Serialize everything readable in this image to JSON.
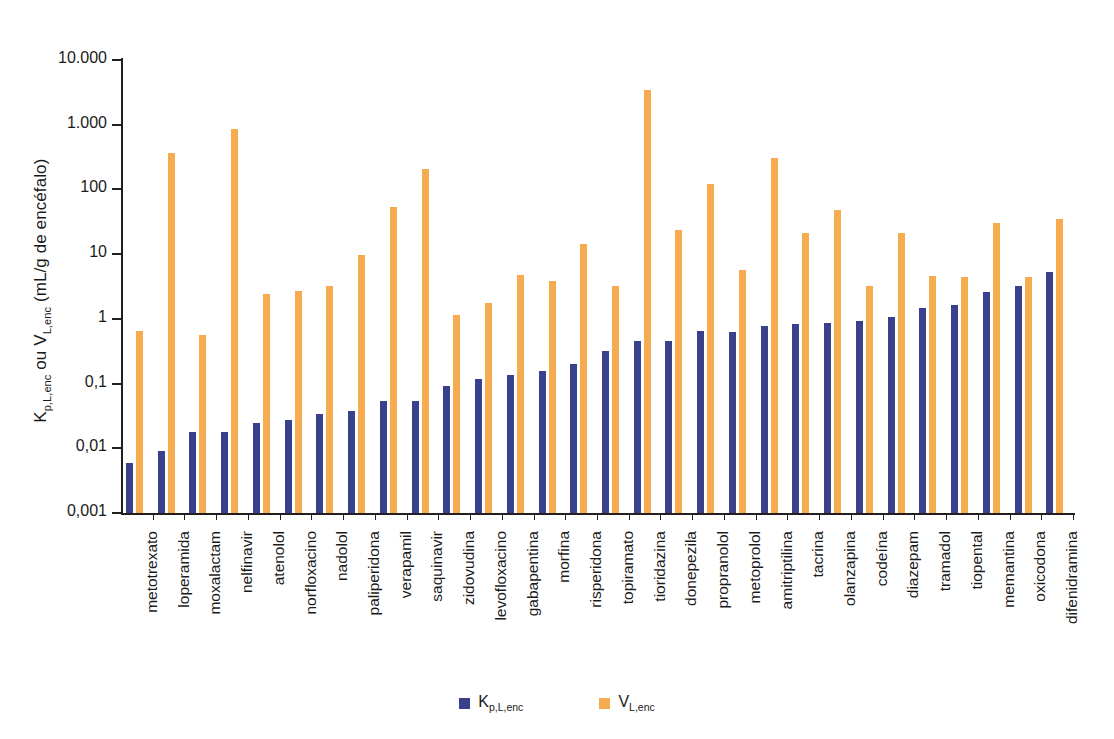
{
  "chart_data": {
    "type": "bar",
    "title": "",
    "xlabel": "",
    "ylabel_html": "K<sub>p,L,enc</sub> ou V<sub>L,enc</sub> (mL/g de encéfalo)",
    "ylabel_text": "Kp,L,enc ou VL,enc (mL/g de encéfalo)",
    "yscale": "log",
    "ylim": [
      0.001,
      10000
    ],
    "ytick_labels": [
      "10.000",
      "1.000",
      "100",
      "10",
      "1",
      "0,1",
      "0,01",
      "0,001"
    ],
    "ytick_values": [
      10000,
      1000,
      100,
      10,
      1,
      0.1,
      0.01,
      0.001
    ],
    "grid": false,
    "legend_position": "bottom-center",
    "categories": [
      "metotrexato",
      "loperamida",
      "moxalactam",
      "nelfinavir",
      "atenolol",
      "norfloxacino",
      "nadolol",
      "paliperidona",
      "verapamil",
      "saquinavir",
      "zidovudina",
      "levofloxacino",
      "gabapentina",
      "morfina",
      "risperidona",
      "topiramato",
      "tioridazina",
      "donepezila",
      "propranolol",
      "metoprolol",
      "amitriptilina",
      "tacrina",
      "olanzapina",
      "codeína",
      "diazepam",
      "tramadol",
      "tiopental",
      "memantina",
      "oxicodona",
      "difenidramina"
    ],
    "series": [
      {
        "name": "K_p,L,enc",
        "name_html": "K<sub>p,L,enc</sub>",
        "color": "#39408c",
        "values": [
          0.006,
          0.009,
          0.018,
          0.018,
          0.025,
          0.027,
          0.034,
          0.038,
          0.054,
          0.053,
          0.092,
          0.118,
          0.137,
          0.155,
          0.198,
          0.32,
          0.46,
          0.45,
          0.64,
          0.63,
          0.78,
          0.84,
          0.85,
          0.92,
          1.08,
          1.48,
          1.65,
          2.6,
          3.2,
          5.3
        ]
      },
      {
        "name": "V_L,enc",
        "name_html": "V<sub>L,enc</sub>",
        "color": "#f7ab51",
        "values": [
          0.66,
          360,
          0.57,
          860,
          2.4,
          2.7,
          3.2,
          9.7,
          53,
          205,
          1.15,
          1.75,
          4.7,
          3.8,
          14.5,
          3.2,
          3400,
          24,
          120,
          5.7,
          310,
          21,
          48,
          3.2,
          21,
          4.6,
          4.4,
          30,
          4.4,
          35
        ]
      }
    ]
  },
  "legend": {
    "entries": [
      {
        "label_text": "Kp,L,enc",
        "label_html": "K<sub>p,L,enc</sub>",
        "color": "#39408c"
      },
      {
        "label_text": "VL,enc",
        "label_html": "V<sub>L,enc</sub>",
        "color": "#f7ab51"
      }
    ]
  },
  "colors": {
    "series_kp": "#39408c",
    "series_vl": "#f7ab51",
    "axis": "#231f20",
    "text": "#1a1a1a",
    "background": "#ffffff"
  }
}
